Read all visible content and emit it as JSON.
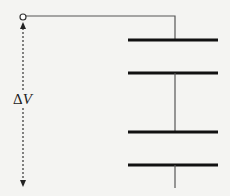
{
  "diagram": {
    "label_delta": "Δ",
    "label_var": "V",
    "components": [
      {
        "type": "terminal",
        "name": "input-terminal"
      },
      {
        "type": "capacitor",
        "name": "capacitor-1"
      },
      {
        "type": "capacitor",
        "name": "capacitor-2"
      }
    ],
    "colors": {
      "line": "#222222",
      "wire": "#555555",
      "background": "#f4f4f2"
    }
  }
}
